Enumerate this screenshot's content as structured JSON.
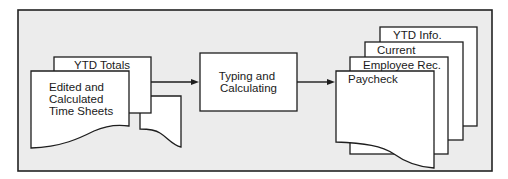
{
  "diagram": {
    "frame": {
      "background": "#ececec",
      "border": "#222222"
    },
    "inputs": {
      "ytd_totals": "YTD Totals",
      "time_sheets": [
        "Edited and",
        "Calculated",
        "Time Sheets"
      ]
    },
    "process": {
      "lines": [
        "Typing and",
        "Calculating"
      ]
    },
    "outputs": {
      "ytd_info": "YTD Info.",
      "current": "Current",
      "employee_rec": "Employee Rec.",
      "paycheck": "Paycheck"
    },
    "colors": {
      "paper": "#ffffff",
      "stroke": "#1e1e1e"
    }
  }
}
